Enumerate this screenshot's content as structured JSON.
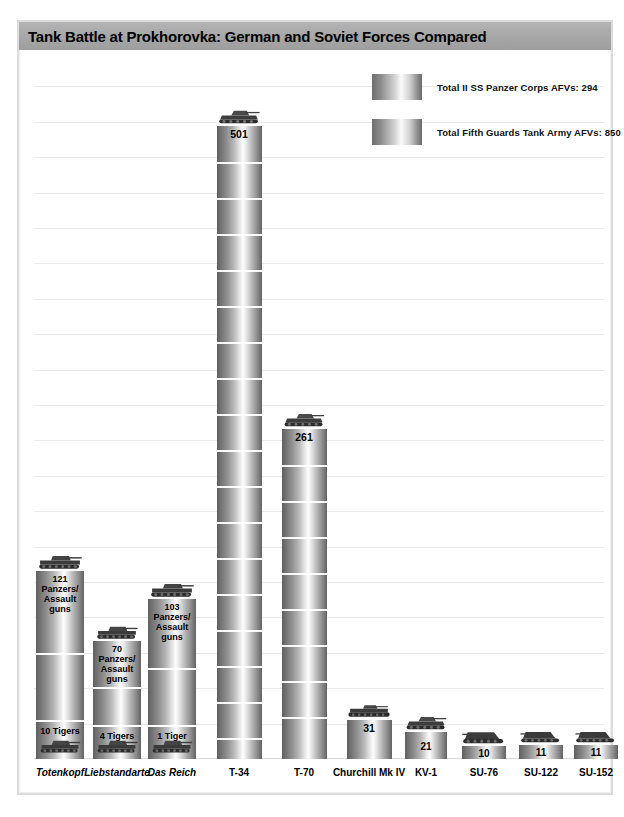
{
  "title": "Tank Battle at Prokhorovka: German and Soviet Forces Compared",
  "legend": [
    {
      "label": "Total II SS Panzer Corps AFVs: 294",
      "swatch": "gray-cylinder"
    },
    {
      "label": "Total Fifth Guards Tank Army AFVs: 850",
      "swatch": "gray-cylinder"
    }
  ],
  "chart_data": {
    "type": "bar",
    "title": "Tank Battle at Prokhorovka: German and Soviet Forces Compared",
    "xlabel": "",
    "ylabel": "",
    "ylim": [
      0,
      560
    ],
    "grid": true,
    "legend_position": "top-right",
    "stacked": true,
    "categories": [
      "Totenkopf",
      "Liebstandarte",
      "Das Reich",
      "T-34",
      "T-70",
      "Churchill Mk IV",
      "KV-1",
      "SU-76",
      "SU-122",
      "SU-152"
    ],
    "series": [
      {
        "name": "Panzers/Assault guns",
        "values": [
          121,
          70,
          103,
          null,
          null,
          null,
          null,
          null,
          null,
          null
        ]
      },
      {
        "name": "Tigers",
        "values": [
          10,
          4,
          1,
          null,
          null,
          null,
          null,
          null,
          null,
          null
        ]
      },
      {
        "name": "Soviet AFVs",
        "values": [
          null,
          null,
          null,
          501,
          261,
          31,
          21,
          10,
          11,
          11
        ]
      }
    ],
    "bars": [
      {
        "category": "Totenkopf",
        "side": "german",
        "total": 131,
        "segments": [
          {
            "value": 121,
            "label": "121 Panzers/ Assault guns",
            "label_lines": [
              "121",
              "Panzers/",
              "Assault guns"
            ]
          },
          {
            "value": 10,
            "label": "10 Tigers",
            "label_lines": [
              "10 Tigers"
            ]
          }
        ]
      },
      {
        "category": "Liebstandarte",
        "side": "german",
        "total": 74,
        "segments": [
          {
            "value": 70,
            "label": "70 Panzers/ Assault guns",
            "label_lines": [
              "70 Panzers/",
              "Assault guns"
            ]
          },
          {
            "value": 4,
            "label": "4 Tigers",
            "label_lines": [
              "4 Tigers"
            ]
          }
        ]
      },
      {
        "category": "Das Reich",
        "side": "german",
        "total": 104,
        "segments": [
          {
            "value": 103,
            "label": "103 Panzers/ Assault guns",
            "label_lines": [
              "103",
              "Panzers/",
              "Assault guns"
            ]
          },
          {
            "value": 1,
            "label": "1 Tiger",
            "label_lines": [
              "1 Tiger"
            ]
          }
        ]
      },
      {
        "category": "T-34",
        "side": "soviet",
        "total": 501,
        "value_label": "501"
      },
      {
        "category": "T-70",
        "side": "soviet",
        "total": 261,
        "value_label": "261"
      },
      {
        "category": "Churchill Mk IV",
        "side": "soviet",
        "total": 31,
        "value_label": "31"
      },
      {
        "category": "KV-1",
        "side": "soviet",
        "total": 21,
        "value_label": "21"
      },
      {
        "category": "SU-76",
        "side": "soviet",
        "total": 10,
        "value_label": "10"
      },
      {
        "category": "SU-122",
        "side": "soviet",
        "total": 11,
        "value_label": "11"
      },
      {
        "category": "SU-152",
        "side": "soviet",
        "total": 11,
        "value_label": "11"
      }
    ]
  },
  "axis_labels": [
    {
      "text": "Totenkopf",
      "italic": true
    },
    {
      "text": "Liebstandarte",
      "italic": true
    },
    {
      "text": "Das Reich",
      "italic": true
    },
    {
      "text": "T-34",
      "italic": false
    },
    {
      "text": "T-70",
      "italic": false
    },
    {
      "text": "Churchill Mk IV",
      "italic": false
    },
    {
      "text": "KV-1",
      "italic": false
    },
    {
      "text": "SU-76",
      "italic": false
    },
    {
      "text": "SU-122",
      "italic": false
    },
    {
      "text": "SU-152",
      "italic": false
    }
  ],
  "bar_labels": {
    "totenkopf_top_l1": "121",
    "totenkopf_top_l2": "Panzers/",
    "totenkopf_top_l3": "Assault guns",
    "totenkopf_bottom": "10 Tigers",
    "lssah_top_l1": "70 Panzers/",
    "lssah_top_l2": "Assault guns",
    "lssah_bottom": "4 Tigers",
    "dasreich_top_l1": "103",
    "dasreich_top_l2": "Panzers/",
    "dasreich_top_l3": "Assault guns",
    "dasreich_bottom": "1 Tiger",
    "t34": "501",
    "t70": "261",
    "churchill": "31",
    "kv1": "21",
    "su76": "10",
    "su122": "11",
    "su152": "11"
  },
  "colors": {
    "title_band": "#a6a6a6",
    "frame": "#dcdcdc",
    "gridline": "#eaeaea",
    "bar_dark": "#5f5f5f",
    "bar_light": "#fdfdfd",
    "text": "#000000"
  }
}
